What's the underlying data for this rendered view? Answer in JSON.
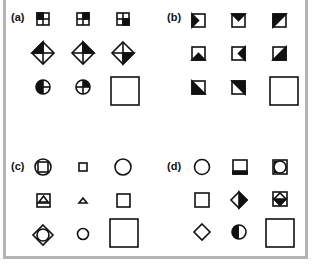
{
  "figure": {
    "panels": [
      {
        "id": "a",
        "label": "(a)",
        "description": "Rotating filled quadrant across square, diamond and circle; missing cell"
      },
      {
        "id": "b",
        "label": "(b)",
        "description": "Squares with black triangular notches/halves; missing cell"
      },
      {
        "id": "c",
        "label": "(c)",
        "description": "Nested and standalone outline shapes (circle, square, triangle, diamond); missing cell"
      },
      {
        "id": "d",
        "label": "(d)",
        "description": "Outline circles, squares, diamonds with partial black fills; missing cell"
      }
    ],
    "colors": {
      "ink": "#111111",
      "frame": "#b4b4b4",
      "background": "#ffffff"
    }
  }
}
